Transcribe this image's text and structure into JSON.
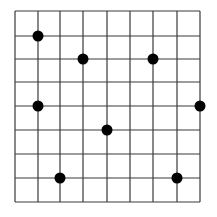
{
  "diagram": {
    "type": "grid-with-dots",
    "grid": {
      "columns": 8,
      "rows": 8,
      "x_lines": [
        15,
        38,
        60,
        83,
        107,
        130,
        153,
        177,
        200
      ],
      "y_lines": [
        11,
        36,
        59,
        82,
        106,
        130,
        154,
        178,
        202
      ],
      "line_color": "#3a3a3a"
    },
    "dot_color": "#000000",
    "dot_radius": 5.5,
    "dots": [
      {
        "col": 1,
        "row": 1
      },
      {
        "col": 3,
        "row": 2
      },
      {
        "col": 6,
        "row": 2
      },
      {
        "col": 1,
        "row": 4
      },
      {
        "col": 8,
        "row": 4
      },
      {
        "col": 4,
        "row": 5
      },
      {
        "col": 2,
        "row": 7
      },
      {
        "col": 7,
        "row": 7
      }
    ]
  }
}
